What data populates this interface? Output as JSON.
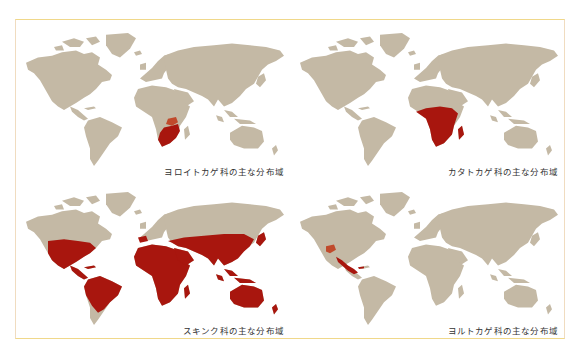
{
  "colors": {
    "background": "#ffffff",
    "land": "#c4b9a5",
    "range_highlight": "#a8160e",
    "frame_border": "#f0d88a"
  },
  "panels": [
    {
      "id": "cordylidae",
      "caption": "ヨロイトカゲ科の主な分布域",
      "highlighted_regions": [
        "Southern Africa",
        "South Africa",
        "Zimbabwe",
        "Mozambique",
        "Zambia (east)"
      ]
    },
    {
      "id": "gerrhosauridae",
      "caption": "カタトカゲ科の主な分布域",
      "highlighted_regions": [
        "Sub-Saharan Africa",
        "Central Africa",
        "East Africa",
        "Southern Africa",
        "Madagascar"
      ]
    },
    {
      "id": "scincidae",
      "caption": "スキンク科の主な分布域",
      "highlighted_regions": [
        "Southern & Central United States",
        "Mexico",
        "Central America",
        "Caribbean",
        "Northern & Central South America",
        "Iberia",
        "Mediterranean",
        "Africa",
        "Middle East",
        "Central Asia (south)",
        "South Asia",
        "China",
        "Japan",
        "Southeast Asia",
        "Indonesia",
        "New Guinea",
        "Australia",
        "New Zealand"
      ]
    },
    {
      "id": "xantusiidae",
      "caption": "ヨルトカゲ科の主な分布域",
      "highlighted_regions": [
        "Southwestern United States",
        "Mexico",
        "Central America",
        "Cuba"
      ]
    }
  ]
}
